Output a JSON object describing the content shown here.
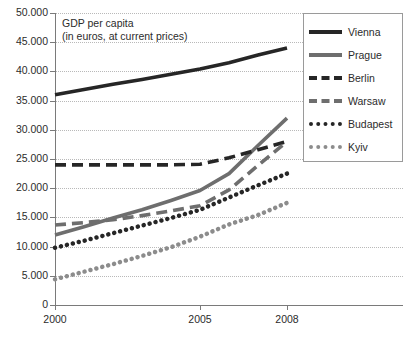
{
  "chart_data": {
    "type": "line",
    "title": "GDP per capita",
    "subtitle": "(in euros, at current prices)",
    "xlabel": "",
    "ylabel": "",
    "ylim": [
      0,
      50000
    ],
    "xlim": [
      2000,
      2008
    ],
    "grid": true,
    "legend_position": "right",
    "y_ticks": [
      "0",
      "5.000",
      "10.000",
      "15.000",
      "20.000",
      "25.000",
      "30.000",
      "35.000",
      "40.000",
      "45.000",
      "50.000"
    ],
    "y_tick_values": [
      0,
      5000,
      10000,
      15000,
      20000,
      25000,
      30000,
      35000,
      40000,
      45000,
      50000
    ],
    "x_ticks": [
      "2000",
      "2005",
      "2008"
    ],
    "x_tick_values": [
      2000,
      2005,
      2008
    ],
    "x": [
      2000,
      2001,
      2002,
      2003,
      2004,
      2005,
      2006,
      2007,
      2008
    ],
    "series": [
      {
        "name": "Vienna",
        "color": "#262626",
        "style": "solid",
        "values": [
          36000,
          36900,
          37800,
          38600,
          39500,
          40400,
          41500,
          42800,
          44000
        ]
      },
      {
        "name": "Prague",
        "color": "#6e6e6e",
        "style": "solid",
        "values": [
          12000,
          13400,
          14900,
          16300,
          17900,
          19600,
          22500,
          27300,
          32000
        ]
      },
      {
        "name": "Berlin",
        "color": "#262626",
        "style": "dashed",
        "values": [
          24000,
          24000,
          24000,
          24000,
          24000,
          24100,
          25200,
          26600,
          28000
        ]
      },
      {
        "name": "Warsaw",
        "color": "#6e6e6e",
        "style": "dashed",
        "values": [
          13700,
          14100,
          14600,
          15300,
          16100,
          17000,
          19700,
          23900,
          28000
        ]
      },
      {
        "name": "Budapest",
        "color": "#262626",
        "style": "dotted",
        "values": [
          9800,
          11000,
          12300,
          13600,
          14900,
          16300,
          18400,
          20500,
          22500
        ]
      },
      {
        "name": "Kyiv",
        "color": "#8c8c8c",
        "style": "dotted",
        "values": [
          4400,
          5700,
          7000,
          8400,
          9900,
          11700,
          13800,
          15400,
          17500
        ]
      }
    ]
  },
  "legend": {
    "items": [
      {
        "label": "Vienna",
        "swatch": "solid-dark"
      },
      {
        "label": "Prague",
        "swatch": "solid-gray"
      },
      {
        "label": "Berlin",
        "swatch": "dash-dark"
      },
      {
        "label": "Warsaw",
        "swatch": "dash-gray"
      },
      {
        "label": "Budapest",
        "swatch": "dot-dark"
      },
      {
        "label": "Kyiv",
        "swatch": "dot-gray"
      }
    ]
  }
}
